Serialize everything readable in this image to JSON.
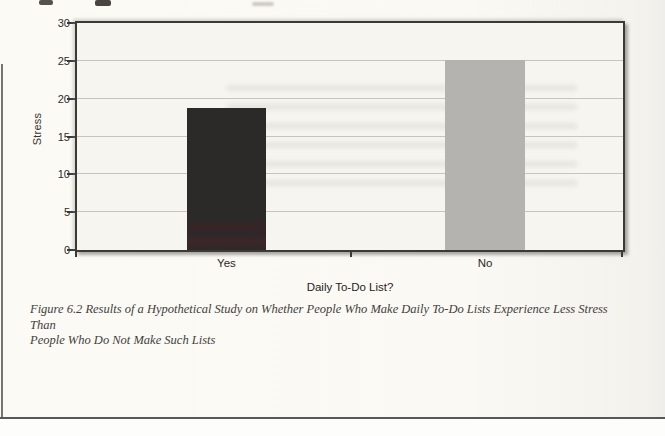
{
  "chart_data": {
    "type": "bar",
    "categories": [
      "Yes",
      "No"
    ],
    "values": [
      18.8,
      25.1
    ],
    "title": "",
    "xlabel": "Daily To-Do List?",
    "ylabel": "Stress",
    "ylim": [
      0,
      30
    ],
    "yticks": [
      0,
      5,
      10,
      15,
      20,
      25,
      30
    ],
    "grid": "horizontal",
    "legend": "none",
    "bar_colors": [
      "#2b2a28",
      "#b5b3b0"
    ]
  },
  "caption": {
    "line1": "Figure 6.2 Results of a Hypothetical Study on Whether People Who Make Daily To-Do Lists Experience Less Stress Than",
    "line2": "People Who Do Not Make Such Lists"
  },
  "colors": {
    "frame": "#3c3a37",
    "gridline": "#c6c4bf",
    "plot_background": "#f6f5f0",
    "page_background": "#fbfaf5"
  }
}
